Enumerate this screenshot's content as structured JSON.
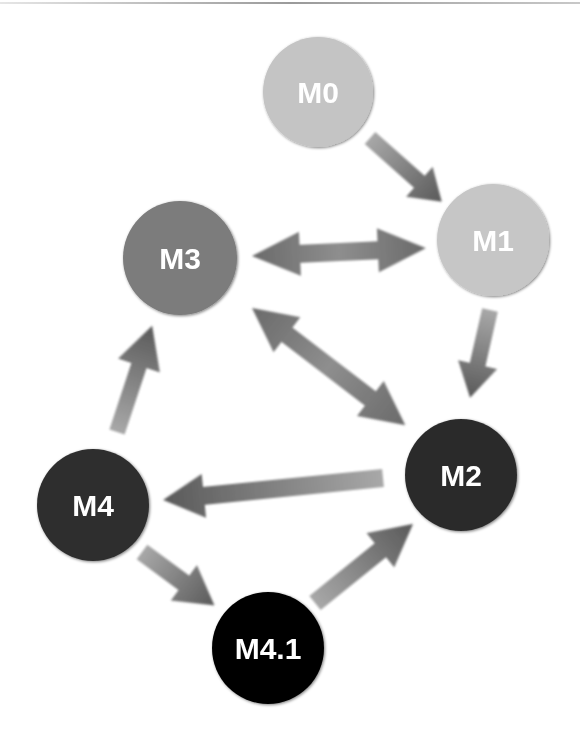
{
  "diagram": {
    "type": "directed-graph",
    "nodes": [
      {
        "id": "M0",
        "label": "M0",
        "cx": 318,
        "cy": 92,
        "r": 55,
        "color": "#c4c4c4"
      },
      {
        "id": "M1",
        "label": "M1",
        "cx": 493,
        "cy": 240,
        "r": 56,
        "color": "#c6c6c6"
      },
      {
        "id": "M3",
        "label": "M3",
        "cx": 180,
        "cy": 258,
        "r": 57,
        "color": "#7b7b7b"
      },
      {
        "id": "M2",
        "label": "M2",
        "cx": 461,
        "cy": 475,
        "r": 56,
        "color": "#2b2b2b"
      },
      {
        "id": "M4",
        "label": "M4",
        "cx": 93,
        "cy": 505,
        "r": 56,
        "color": "#2e2e2e"
      },
      {
        "id": "M4.1",
        "label": "M4.1",
        "cx": 268,
        "cy": 648,
        "r": 56,
        "color": "#050505"
      }
    ],
    "edges": [
      {
        "from": "M0",
        "to": "M1",
        "bidirectional": false
      },
      {
        "from": "M3",
        "to": "M1",
        "bidirectional": true
      },
      {
        "from": "M1",
        "to": "M2",
        "bidirectional": false
      },
      {
        "from": "M3",
        "to": "M2",
        "bidirectional": true
      },
      {
        "from": "M2",
        "to": "M4",
        "bidirectional": false
      },
      {
        "from": "M4",
        "to": "M3",
        "bidirectional": false
      },
      {
        "from": "M4",
        "to": "M4.1",
        "bidirectional": false
      },
      {
        "from": "M4.1",
        "to": "M2",
        "bidirectional": false
      }
    ],
    "arrow_color_dark": "#5a5a5a",
    "arrow_color_light": "#a8a8a8"
  }
}
